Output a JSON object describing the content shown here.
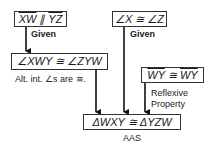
{
  "diagram": {
    "type": "flow-proof",
    "nodes": [
      {
        "id": "n1",
        "parts": [
          {
            "text": "XW",
            "overline": true
          },
          {
            "text": " ∥ ",
            "overline": false
          },
          {
            "text": "YZ",
            "overline": true
          }
        ],
        "reason": "Given"
      },
      {
        "id": "n2",
        "text": "∠XWY ≅ ∠ZYW",
        "reason": "Alt. int. ∠s are ≅."
      },
      {
        "id": "n3",
        "text": "∠X ≅ ∠Z",
        "reason": "Given"
      },
      {
        "id": "n4",
        "parts": [
          {
            "text": "WY",
            "overline": true
          },
          {
            "text": " ≅ ",
            "overline": false
          },
          {
            "text": "WY",
            "overline": true
          }
        ],
        "reason_line1": "Reflexive",
        "reason_line2": "Property"
      },
      {
        "id": "n5",
        "text": "ΔWXY ≅ ΔYZW",
        "reason": "AAS"
      }
    ],
    "edges": [
      {
        "from": "n1",
        "to": "n2"
      },
      {
        "from": "n2",
        "to": "n5"
      },
      {
        "from": "n3",
        "to": "n5"
      },
      {
        "from": "n4",
        "to": "n5"
      }
    ]
  }
}
